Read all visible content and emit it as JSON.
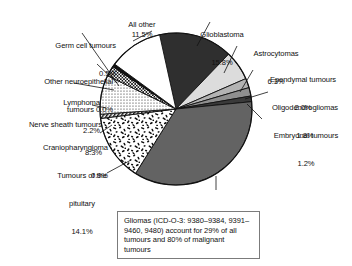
{
  "chart_data": {
    "type": "pie",
    "title": "",
    "xlabel": "",
    "ylabel": "",
    "legend_position": "callout-labels",
    "units": "percent",
    "categories": [
      "Glioblastoma",
      "Astrocytomas",
      "Ependymal tumours",
      "Oligodendrogliomas",
      "Embryonal tumours",
      "Meningioma",
      "Tumours of the pituitary",
      "Craniopharyngioma",
      "Nerve sheath tumours",
      "Lymphoma",
      "Other neuroepithelial tumours",
      "Germ cell tumours",
      "All other"
    ],
    "values": [
      15.8,
      6.3,
      2.0,
      1.8,
      1.2,
      35.5,
      14.1,
      0.9,
      8.3,
      2.2,
      0.0,
      0.5,
      11.5
    ],
    "slices": [
      {
        "name": "Glioblastoma",
        "value": 15.8,
        "value_label": "15.8%",
        "fill": "#2f2f2f",
        "pattern": "solid"
      },
      {
        "name": "Astrocytomas",
        "value": 6.3,
        "value_label": "6.3%",
        "fill": "#dcdcdc",
        "pattern": "solid"
      },
      {
        "name": "Ependymal tumours",
        "value": 2.0,
        "value_label": "2.0%",
        "fill": "#b3b3b3",
        "pattern": "solid"
      },
      {
        "name": "Oligodendrogliomas",
        "value": 1.8,
        "value_label": "1.8%",
        "fill": "#8f8f8f",
        "pattern": "solid"
      },
      {
        "name": "Embryonal tumours",
        "value": 1.2,
        "value_label": "1.2%",
        "fill": "#3a3a3a",
        "pattern": "solid"
      },
      {
        "name": "Meningioma",
        "value": 35.5,
        "value_label": "35.5%",
        "fill": "#636363",
        "pattern": "solid"
      },
      {
        "name": "Tumours of the pituitary",
        "value": 14.1,
        "value_label": "14.1%",
        "fill": "#ffffff",
        "pattern": "speckle"
      },
      {
        "name": "Craniopharyngioma",
        "value": 0.9,
        "value_label": "0.9%",
        "fill": "#ffffff",
        "pattern": "hatch"
      },
      {
        "name": "Nerve sheath tumours",
        "value": 8.3,
        "value_label": "8.3%",
        "fill": "#ffffff",
        "pattern": "dots"
      },
      {
        "name": "Lymphoma",
        "value": 2.2,
        "value_label": "2.2%",
        "fill": "#ffffff",
        "pattern": "checker"
      },
      {
        "name": "Other neuroepithelial tumours",
        "value": 0.0,
        "value_label": "0.0%",
        "fill": "#111111",
        "pattern": "solid"
      },
      {
        "name": "Germ cell tumours",
        "value": 0.5,
        "value_label": "0.5%",
        "fill": "#111111",
        "pattern": "solid"
      },
      {
        "name": "All other",
        "value": 11.5,
        "value_label": "11.5%",
        "fill": "#ffffff",
        "pattern": "solid"
      }
    ]
  },
  "labels": {
    "all_other": {
      "name": "All other",
      "value": "11.5%"
    },
    "germ_cell": {
      "name": "Germ cell tumours",
      "value": "0.5%"
    },
    "other_neuroepithelial": {
      "line1": "Other neuroepithelial",
      "line2": "tumours 0.0%"
    },
    "lymphoma": {
      "name": "Lymphoma",
      "value": "2.2%"
    },
    "nerve_sheath": {
      "name": "Nerve sheath tumours",
      "value": "8.3%"
    },
    "craniopharyngioma": {
      "name": "Craniopharyngioma",
      "value": "0.9%"
    },
    "pituitary": {
      "line1": "Tumours of the",
      "line2": "pituitary",
      "value": "14.1%"
    },
    "glioblastoma": {
      "name": "Glioblastoma",
      "value": "15.8%"
    },
    "astrocytomas": {
      "name": "Astrocytomas",
      "value": "6.3%"
    },
    "ependymal": {
      "name": "Ependymal tumours",
      "value": "2.0%"
    },
    "oligodendrogliomas": {
      "name": "Oligodendrogliomas",
      "value": "1.8%"
    },
    "embryonal": {
      "name": "Embryonal tumours",
      "value": "1.2%"
    },
    "meningioma": {
      "name": "Meningioma",
      "value": "35.5%"
    }
  },
  "caption": {
    "text": "Gliomas (ICD-O-3: 9380–9384, 9391–9460, 9480) account for 29% of all tumours and 80% of malignant tumours"
  },
  "colors": {
    "glioblastoma": "#2f2f2f",
    "meningioma": "#636363",
    "astrocytomas": "#dcdcdc",
    "ependymal": "#b3b3b3",
    "oligodendrogliomas": "#8f8f8f",
    "embryonal": "#3a3a3a",
    "outline": "#111111",
    "caption_border": "#7b7b7b"
  }
}
